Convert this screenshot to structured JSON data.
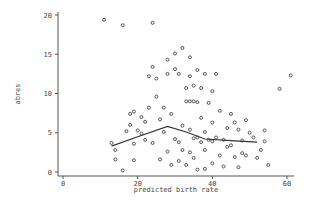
{
  "chart_data": {
    "type": "scatter",
    "title": "",
    "xlabel": "predicted birth rate",
    "ylabel": "abres",
    "xlim": [
      0,
      62
    ],
    "ylim": [
      0,
      20.5
    ],
    "xticks": [
      0,
      20,
      40,
      60
    ],
    "yticks": [
      0,
      5,
      10,
      15,
      20
    ],
    "grid": false,
    "legend": null,
    "series": [
      {
        "name": "observations",
        "kind": "scatter",
        "marker": "hollow-circle",
        "points": [
          [
            11,
            19.4
          ],
          [
            16,
            18.7
          ],
          [
            24,
            19.0
          ],
          [
            13,
            3.7
          ],
          [
            14,
            1.6
          ],
          [
            14,
            2.8
          ],
          [
            16,
            0.2
          ],
          [
            17,
            5.2
          ],
          [
            18,
            6.0
          ],
          [
            18,
            7.4
          ],
          [
            19,
            7.7
          ],
          [
            19,
            3.6
          ],
          [
            19,
            1.5
          ],
          [
            20,
            5.3
          ],
          [
            21,
            4.9
          ],
          [
            21,
            7.0
          ],
          [
            22,
            6.4
          ],
          [
            22,
            4.1
          ],
          [
            23,
            8.2
          ],
          [
            23,
            12.2
          ],
          [
            24,
            13.4
          ],
          [
            24,
            3.7
          ],
          [
            25,
            11.9
          ],
          [
            25,
            9.6
          ],
          [
            26,
            6.7
          ],
          [
            26,
            1.6
          ],
          [
            27,
            8.2
          ],
          [
            27,
            5.1
          ],
          [
            28,
            14.3
          ],
          [
            28,
            12.5
          ],
          [
            28,
            2.6
          ],
          [
            29,
            0.9
          ],
          [
            29,
            7.4
          ],
          [
            30,
            13.1
          ],
          [
            30,
            15.1
          ],
          [
            30,
            4.2
          ],
          [
            31,
            12.5
          ],
          [
            31,
            3.8
          ],
          [
            31,
            1.4
          ],
          [
            32,
            15.8
          ],
          [
            32,
            5.9
          ],
          [
            32,
            2.8
          ],
          [
            33,
            10.7
          ],
          [
            33,
            9.0
          ],
          [
            33,
            0.9
          ],
          [
            34,
            14.6
          ],
          [
            34,
            12.2
          ],
          [
            34,
            9.0
          ],
          [
            34,
            5.4
          ],
          [
            34,
            2.5
          ],
          [
            35,
            9.0
          ],
          [
            35,
            11.0
          ],
          [
            35,
            4.3
          ],
          [
            35,
            1.8
          ],
          [
            36,
            13.0
          ],
          [
            36,
            8.9
          ],
          [
            36,
            4.4
          ],
          [
            36,
            0.3
          ],
          [
            37,
            10.7
          ],
          [
            37,
            6.9
          ],
          [
            37,
            3.8
          ],
          [
            38,
            12.5
          ],
          [
            38,
            5.1
          ],
          [
            38,
            2.8
          ],
          [
            38,
            0.4
          ],
          [
            39,
            8.8
          ],
          [
            39,
            4.1
          ],
          [
            40,
            10.3
          ],
          [
            40,
            6.3
          ],
          [
            40,
            3.9
          ],
          [
            40,
            1.1
          ],
          [
            41,
            12.5
          ],
          [
            41,
            4.4
          ],
          [
            42,
            7.8
          ],
          [
            42,
            2.1
          ],
          [
            43,
            4.1
          ],
          [
            43,
            0.7
          ],
          [
            44,
            5.6
          ],
          [
            44,
            3.2
          ],
          [
            45,
            7.4
          ],
          [
            45,
            3.4
          ],
          [
            46,
            6.3
          ],
          [
            46,
            1.9
          ],
          [
            47,
            5.4
          ],
          [
            47,
            0.6
          ],
          [
            48,
            4.0
          ],
          [
            48,
            2.4
          ],
          [
            49,
            6.6
          ],
          [
            49,
            2.1
          ],
          [
            50,
            5.0
          ],
          [
            51,
            4.4
          ],
          [
            52,
            1.8
          ],
          [
            53,
            2.8
          ],
          [
            54,
            5.3
          ],
          [
            54,
            3.9
          ],
          [
            55,
            0.9
          ],
          [
            58,
            10.6
          ],
          [
            61,
            12.3
          ]
        ]
      },
      {
        "name": "smoothed",
        "kind": "line",
        "points": [
          [
            13,
            3.3
          ],
          [
            20,
            4.5
          ],
          [
            28,
            5.8
          ],
          [
            33,
            5.1
          ],
          [
            38,
            4.2
          ],
          [
            45,
            4.0
          ],
          [
            52,
            3.8
          ]
        ]
      }
    ]
  },
  "axes": {
    "x": {
      "title": "predicted birth rate",
      "ticks": [
        "0",
        "20",
        "40",
        "60"
      ]
    },
    "y": {
      "title": "abres",
      "ticks": [
        "0",
        "5",
        "10",
        "15",
        "20"
      ]
    }
  }
}
